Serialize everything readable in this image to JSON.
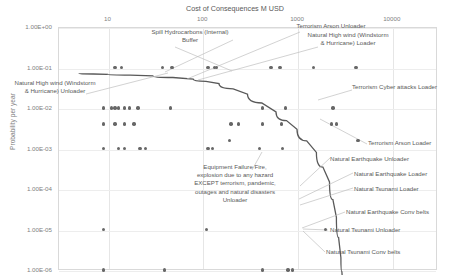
{
  "chart_data": {
    "type": "scatter",
    "title": "",
    "xlabel": "Cost of Consequences M USD",
    "ylabel": "Probability per year",
    "xscale": "log",
    "yscale": "log",
    "xlim": [
      3,
      30000
    ],
    "ylim": [
      1e-06,
      1
    ],
    "xticks": [
      "10",
      "100",
      "1000",
      "10000"
    ],
    "yticks": [
      "1.00E+00",
      "1.00E-01",
      "1.00E-02",
      "1.00E-03",
      "1.00E-04",
      "1.00E-05",
      "1.00E-06"
    ],
    "grid": true,
    "legend": "none",
    "series": [
      {
        "name": "Risk events",
        "points": [
          {
            "x": 12,
            "y": 0.1
          },
          {
            "x": 14,
            "y": 0.1
          },
          {
            "x": 38,
            "y": 0.1
          },
          {
            "x": 48,
            "y": 0.1
          },
          {
            "x": 115,
            "y": 0.1
          },
          {
            "x": 135,
            "y": 0.1
          },
          {
            "x": 142,
            "y": 0.1
          },
          {
            "x": 530,
            "y": 0.1
          },
          {
            "x": 660,
            "y": 0.1
          },
          {
            "x": 1500,
            "y": 0.1
          },
          {
            "x": 4200,
            "y": 0.1
          },
          {
            "x": 9,
            "y": 0.01
          },
          {
            "x": 11,
            "y": 0.01
          },
          {
            "x": 12,
            "y": 0.01
          },
          {
            "x": 13,
            "y": 0.01
          },
          {
            "x": 15,
            "y": 0.01
          },
          {
            "x": 17,
            "y": 0.01
          },
          {
            "x": 21,
            "y": 0.01
          },
          {
            "x": 46,
            "y": 0.01
          },
          {
            "x": 430,
            "y": 0.01
          },
          {
            "x": 760,
            "y": 0.01
          },
          {
            "x": 2400,
            "y": 0.01
          },
          {
            "x": 9,
            "y": 0.004
          },
          {
            "x": 12,
            "y": 0.004
          },
          {
            "x": 15,
            "y": 0.004
          },
          {
            "x": 19,
            "y": 0.004
          },
          {
            "x": 200,
            "y": 0.004
          },
          {
            "x": 240,
            "y": 0.004
          },
          {
            "x": 430,
            "y": 0.004
          },
          {
            "x": 690,
            "y": 0.004
          },
          {
            "x": 2300,
            "y": 0.004
          },
          {
            "x": 2600,
            "y": 0.004
          },
          {
            "x": 195,
            "y": 0.0016
          },
          {
            "x": 4400,
            "y": 0.0016
          },
          {
            "x": 9,
            "y": 0.001
          },
          {
            "x": 13,
            "y": 0.001
          },
          {
            "x": 15,
            "y": 0.001
          },
          {
            "x": 22,
            "y": 0.001
          },
          {
            "x": 25,
            "y": 0.001
          },
          {
            "x": 115,
            "y": 0.001
          },
          {
            "x": 128,
            "y": 0.001
          },
          {
            "x": 400,
            "y": 0.001
          },
          {
            "x": 700,
            "y": 0.001
          },
          {
            "x": 9,
            "y": 1e-05
          },
          {
            "x": 110,
            "y": 1e-05
          },
          {
            "x": 2000,
            "y": 1e-05
          },
          {
            "x": 9,
            "y": 1e-06
          },
          {
            "x": 40,
            "y": 1e-06
          },
          {
            "x": 430,
            "y": 1e-06
          },
          {
            "x": 800,
            "y": 1e-06
          },
          {
            "x": 900,
            "y": 1e-06
          }
        ]
      }
    ],
    "annotations": [
      {
        "id": "spill-hydrocarbons-internal-buffer",
        "text": "Spill Hydrocarbons (Internal)\nBuffer"
      },
      {
        "id": "terrorism-arson-unloader",
        "text": "Terrorism Arson Unloader"
      },
      {
        "id": "natural-high-wind-loader",
        "text": "Natural High wind (Windstorm\n& Hurricane) Loader"
      },
      {
        "id": "natural-high-wind-unloader",
        "text": "Natural High wind (Windstorm\n& Hurricane) Unloader"
      },
      {
        "id": "terrorism-cyber-attacks-loader",
        "text": "Terrorism Cyber attacks Loader"
      },
      {
        "id": "terrorism-arson-loader",
        "text": "Terrorism Arson Loader"
      },
      {
        "id": "natural-earthquake-unloader",
        "text": "Natural Earthquake Unloader"
      },
      {
        "id": "natural-earthquake-loader",
        "text": "Natural Earthquake Loader"
      },
      {
        "id": "natural-tsunami-loader",
        "text": "Natural Tsunami Loader"
      },
      {
        "id": "natural-earthquake-conv-belts",
        "text": "Natural Earthquake Conv belts"
      },
      {
        "id": "natural-tsunami-unloader",
        "text": "Natural Tsunami Unloader"
      },
      {
        "id": "natural-tsunami-conv-belts",
        "text": "Natural Tsunami Conv belts"
      },
      {
        "id": "equipment-failure-fire-unloader",
        "text": "Equipment Failure Fire,\nexplosion due to any hazard\nEXCEPT terrorism, pandemic,\noutages and natural disasters\nUnloader"
      }
    ],
    "trend_curve": {
      "name": "risk tolerance curve",
      "color": "#595959",
      "points": [
        {
          "x": 5,
          "y": 0.07
        },
        {
          "x": 10,
          "y": 0.068
        },
        {
          "x": 30,
          "y": 0.062
        },
        {
          "x": 80,
          "y": 0.052
        },
        {
          "x": 150,
          "y": 0.04
        },
        {
          "x": 300,
          "y": 0.022
        },
        {
          "x": 600,
          "y": 0.008
        },
        {
          "x": 1000,
          "y": 0.003
        },
        {
          "x": 1600,
          "y": 0.0008
        },
        {
          "x": 2200,
          "y": 0.00015
        },
        {
          "x": 2600,
          "y": 2e-05
        },
        {
          "x": 2900,
          "y": 2e-06
        },
        {
          "x": 3050,
          "y": 4e-07
        }
      ]
    }
  },
  "axis": {
    "xtitle": "Cost of Consequences M USD",
    "ytitle": "Probability per year"
  },
  "xticks": [
    "10",
    "100",
    "1000",
    "10000"
  ],
  "yticks": [
    "1.00E+00",
    "1.00E-01",
    "1.00E-02",
    "1.00E-03",
    "1.00E-04",
    "1.00E-05",
    "1.00E-06"
  ],
  "labels": {
    "spill_hydrocarbons": "Spill Hydrocarbons (Internal)\nBuffer",
    "terrorism_arson_unloader": "Terrorism Arson Unloader",
    "natural_high_wind_loader": "Natural High wind (Windstorm\n& Hurricane) Loader",
    "natural_high_wind_unloader": "Natural High wind (Windstorm\n& Hurricane) Unloader",
    "terrorism_cyber_attacks_loader": "Terrorism Cyber attacks Loader",
    "terrorism_arson_loader": "Terrorism Arson Loader",
    "natural_earthquake_unloader": "Natural Earthquake Unloader",
    "natural_earthquake_loader": "Natural Earthquake Loader",
    "natural_tsunami_loader": "Natural Tsunami Loader",
    "natural_earthquake_conv_belts": "Natural Earthquake Conv belts",
    "natural_tsunami_unloader": "Natural Tsunami Unloader",
    "natural_tsunami_conv_belts": "Natural Tsunami Conv belts",
    "equipment_failure": "Equipment Failure Fire,\nexplosion due to any hazard\nEXCEPT terrorism, pandemic,\noutages and natural disasters\nUnloader"
  },
  "colors": {
    "point": "#676767",
    "curve": "#595959",
    "grid": "#e6e6e6",
    "text": "#595959"
  }
}
